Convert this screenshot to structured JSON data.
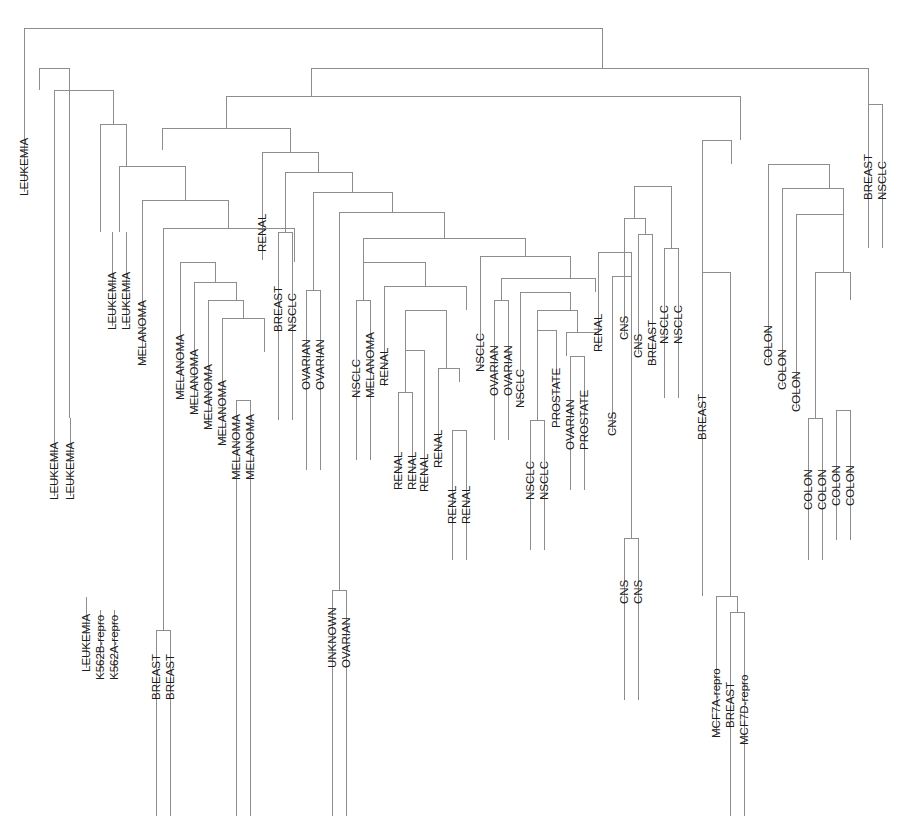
{
  "figure": {
    "title": "",
    "type": "dendrogram",
    "orientation": "top-down",
    "leaf_count": 64,
    "line_color": "#8d8d8d",
    "label_color": "#1c1c1c",
    "background": "#ffffff"
  },
  "chart_data": {
    "type": "dendrogram",
    "title": "",
    "xlabel": "",
    "ylabel": "",
    "grid": false,
    "legend": "none",
    "orientation": "vertical-top-root",
    "leaf_labels": [
      "LEUKEMIA",
      "LEUKEMIA",
      "LEUKEMIA",
      "LEUKEMIA",
      "K562B-repro",
      "K562A-repro",
      "LEUKEMIA",
      "LEUKEMIA",
      "MELANOMA",
      "BREAST",
      "BREAST",
      "MELANOMA",
      "MELANOMA",
      "MELANOMA",
      "MELANOMA",
      "MELANOMA",
      "MELANOMA",
      "RENAL",
      "BREAST",
      "NSCLC",
      "OVARIAN",
      "OVARIAN",
      "UNKNOWN",
      "OVARIAN",
      "NSCLC",
      "MELANOMA",
      "RENAL",
      "RENAL",
      "RENAL",
      "RENAL",
      "RENAL",
      "RENAL",
      "RENAL",
      "NSCLC",
      "OVARIAN",
      "OVARIAN",
      "NSCLC",
      "NSCLC",
      "NSCLC",
      "PROSTATE",
      "OVARIAN",
      "PROSTATE",
      "RENAL",
      "CNS",
      "CNS",
      "CNS",
      "CNS",
      "CNS",
      "BREAST",
      "NSCLC",
      "NSCLC",
      "BREAST",
      "MCF7A-repro",
      "BREAST",
      "MCF7D-repro",
      "COLON",
      "COLON",
      "COLON",
      "COLON",
      "COLON",
      "COLON",
      "COLON",
      "BREAST",
      "NSCLC"
    ],
    "leaf_x": [
      24,
      54,
      84,
      100,
      114,
      128,
      148,
      162,
      178,
      164,
      178,
      196,
      210,
      224,
      238,
      248,
      262,
      260,
      274,
      288,
      303,
      317,
      332,
      346,
      358,
      372,
      386,
      399,
      412,
      426,
      450,
      463,
      477,
      487,
      500,
      513,
      527,
      540,
      553,
      566,
      579,
      592,
      607,
      623,
      637,
      651,
      629,
      643,
      657,
      671,
      685,
      703,
      717,
      731,
      745,
      779,
      793,
      807,
      818,
      829,
      842,
      855,
      869,
      883
    ],
    "merge_heights_note": "Heights read from pixel y positions of horizontal join bars; smaller y = larger distance."
  },
  "labels": {
    "leukemia": "LEUKEMIA",
    "k562b": "K562B-repro",
    "k562a": "K562A-repro",
    "melanoma": "MELANOMA",
    "breast": "BREAST",
    "nsclc": "NSCLC",
    "renal": "RENAL",
    "ovarian": "OVARIAN",
    "unknown": "UNKNOWN",
    "prostate": "PROSTATE",
    "cns": "CNS",
    "colon": "COLON",
    "mcf7a": "MCF7A-repro",
    "mcf7d": "MCF7D-repro"
  },
  "leaves": [
    {
      "label": "LEUKEMIA",
      "x": 24,
      "y": 52,
      "label_y": 196
    },
    {
      "label": "LEUKEMIA",
      "x": 54,
      "y": 418,
      "label_y": 500
    },
    {
      "label": "LEUKEMIA",
      "x": 70,
      "y": 418,
      "label_y": 500
    },
    {
      "label": "LEUKEMIA",
      "x": 86,
      "y": 597,
      "label_y": 672
    },
    {
      "label": "K562B-repro",
      "x": 100,
      "y": 610,
      "label_y": 680
    },
    {
      "label": "K562A-repro",
      "x": 114,
      "y": 610,
      "label_y": 680
    },
    {
      "label": "LEUKEMIA",
      "x": 112,
      "y": 232,
      "label_y": 330
    },
    {
      "label": "LEUKEMIA",
      "x": 126,
      "y": 232,
      "label_y": 330
    },
    {
      "label": "MELANOMA",
      "x": 142,
      "y": 270,
      "label_y": 366
    },
    {
      "label": "BREAST",
      "x": 156,
      "y": 630,
      "label_y": 700
    },
    {
      "label": "BREAST",
      "x": 170,
      "y": 630,
      "label_y": 700
    },
    {
      "label": "MELANOMA",
      "x": 180,
      "y": 305,
      "label_y": 400
    },
    {
      "label": "MELANOMA",
      "x": 194,
      "y": 320,
      "label_y": 415
    },
    {
      "label": "MELANOMA",
      "x": 208,
      "y": 336,
      "label_y": 430
    },
    {
      "label": "MELANOMA",
      "x": 222,
      "y": 348,
      "label_y": 446
    },
    {
      "label": "MELANOMA",
      "x": 236,
      "y": 400,
      "label_y": 480
    },
    {
      "label": "MELANOMA",
      "x": 250,
      "y": 400,
      "label_y": 480
    },
    {
      "label": "RENAL",
      "x": 262,
      "y": 152,
      "label_y": 252
    },
    {
      "label": "BREAST",
      "x": 278,
      "y": 232,
      "label_y": 332
    },
    {
      "label": "NSCLC",
      "x": 292,
      "y": 232,
      "label_y": 332
    },
    {
      "label": "OVARIAN",
      "x": 306,
      "y": 290,
      "label_y": 390
    },
    {
      "label": "OVARIAN",
      "x": 320,
      "y": 290,
      "label_y": 390
    },
    {
      "label": "UNKNOWN",
      "x": 332,
      "y": 590,
      "label_y": 668
    },
    {
      "label": "OVARIAN",
      "x": 346,
      "y": 590,
      "label_y": 668
    },
    {
      "label": "NSCLC",
      "x": 356,
      "y": 300,
      "label_y": 398
    },
    {
      "label": "MELANOMA",
      "x": 370,
      "y": 300,
      "label_y": 398
    },
    {
      "label": "RENAL",
      "x": 384,
      "y": 286,
      "label_y": 386
    },
    {
      "label": "RENAL",
      "x": 398,
      "y": 392,
      "label_y": 490
    },
    {
      "label": "RENAL",
      "x": 412,
      "y": 392,
      "label_y": 490
    },
    {
      "label": "RENAL",
      "x": 424,
      "y": 398,
      "label_y": 492
    },
    {
      "label": "RENAL",
      "x": 438,
      "y": 368,
      "label_y": 468
    },
    {
      "label": "RENAL",
      "x": 452,
      "y": 430,
      "label_y": 524
    },
    {
      "label": "RENAL",
      "x": 466,
      "y": 430,
      "label_y": 524
    },
    {
      "label": "NSCLC",
      "x": 480,
      "y": 272,
      "label_y": 372
    },
    {
      "label": "OVARIAN",
      "x": 494,
      "y": 300,
      "label_y": 396
    },
    {
      "label": "OVARIAN",
      "x": 508,
      "y": 300,
      "label_y": 396
    },
    {
      "label": "NSCLC",
      "x": 520,
      "y": 312,
      "label_y": 408
    },
    {
      "label": "NSCLC",
      "x": 530,
      "y": 420,
      "label_y": 500
    },
    {
      "label": "NSCLC",
      "x": 544,
      "y": 420,
      "label_y": 500
    },
    {
      "label": "PROSTATE",
      "x": 556,
      "y": 332,
      "label_y": 428
    },
    {
      "label": "OVARIAN",
      "x": 570,
      "y": 356,
      "label_y": 450
    },
    {
      "label": "PROSTATE",
      "x": 584,
      "y": 356,
      "label_y": 450
    },
    {
      "label": "RENAL",
      "x": 598,
      "y": 252,
      "label_y": 352
    },
    {
      "label": "CNS",
      "x": 612,
      "y": 362,
      "label_y": 436
    },
    {
      "label": "CNS",
      "x": 624,
      "y": 538,
      "label_y": 604
    },
    {
      "label": "CNS",
      "x": 638,
      "y": 538,
      "label_y": 604
    },
    {
      "label": "CNS",
      "x": 624,
      "y": 250,
      "label_y": 340
    },
    {
      "label": "CNS",
      "x": 638,
      "y": 268,
      "label_y": 358
    },
    {
      "label": "BREAST",
      "x": 652,
      "y": 268,
      "label_y": 366
    },
    {
      "label": "NSCLC",
      "x": 664,
      "y": 248,
      "label_y": 344
    },
    {
      "label": "NSCLC",
      "x": 678,
      "y": 248,
      "label_y": 344
    },
    {
      "label": "BREAST",
      "x": 702,
      "y": 272,
      "label_y": 440
    },
    {
      "label": "MCF7A-repro",
      "x": 716,
      "y": 630,
      "label_y": 738
    },
    {
      "label": "BREAST",
      "x": 730,
      "y": 630,
      "label_y": 728
    },
    {
      "label": "MCF7D-repro",
      "x": 744,
      "y": 645,
      "label_y": 745
    },
    {
      "label": "COLON",
      "x": 768,
      "y": 268,
      "label_y": 366
    },
    {
      "label": "COLON",
      "x": 782,
      "y": 292,
      "label_y": 390
    },
    {
      "label": "COLON",
      "x": 796,
      "y": 316,
      "label_y": 412
    },
    {
      "label": "COLON",
      "x": 808,
      "y": 418,
      "label_y": 510
    },
    {
      "label": "COLON",
      "x": 822,
      "y": 418,
      "label_y": 510
    },
    {
      "label": "COLON",
      "x": 836,
      "y": 410,
      "label_y": 506
    },
    {
      "label": "COLON",
      "x": 850,
      "y": 410,
      "label_y": 506
    },
    {
      "label": "BREAST",
      "x": 868,
      "y": 104,
      "label_y": 200
    },
    {
      "label": "NSCLC",
      "x": 882,
      "y": 104,
      "label_y": 200
    }
  ],
  "links": [
    {
      "x1": 24,
      "x2": 602,
      "y": 28,
      "p1y": 52,
      "p2y": 68,
      "name": "root"
    },
    {
      "x1": 39,
      "x2": 69,
      "y": 68,
      "p1y": 90,
      "p2y": 418,
      "name": "leuk-node-a"
    },
    {
      "x1": 54,
      "x2": 113,
      "y": 90,
      "p1y": 418,
      "p2y": 124,
      "name": "leuk-node-b"
    },
    {
      "x1": 100,
      "x2": 126,
      "y": 124,
      "p1y": 232,
      "p2y": 166,
      "name": "leuk-node-c"
    },
    {
      "x1": 119,
      "x2": 185,
      "y": 166,
      "p1y": 232,
      "p2y": 200,
      "name": "mel-clade-root"
    },
    {
      "x1": 142,
      "x2": 228,
      "y": 200,
      "p1y": 270,
      "p2y": 228,
      "name": "mel-node-a"
    },
    {
      "x1": 163,
      "x2": 294,
      "y": 228,
      "p1y": 630,
      "p2y": 262,
      "name": "mel-node-b"
    },
    {
      "x1": 156,
      "x2": 170,
      "y": 630,
      "p1y": 816,
      "p2y": 816,
      "name": "breast-pair-low"
    },
    {
      "x1": 180,
      "x2": 215,
      "y": 262,
      "p1y": 305,
      "p2y": 282,
      "name": "mel-node-c"
    },
    {
      "x1": 194,
      "x2": 236,
      "y": 282,
      "p1y": 320,
      "p2y": 300,
      "name": "mel-node-d"
    },
    {
      "x1": 208,
      "x2": 243,
      "y": 300,
      "p1y": 336,
      "p2y": 318,
      "name": "mel-node-e"
    },
    {
      "x1": 222,
      "x2": 264,
      "y": 318,
      "p1y": 348,
      "p2y": 352,
      "name": "mel-node-f"
    },
    {
      "x1": 236,
      "x2": 250,
      "y": 400,
      "p1y": 816,
      "p2y": 816,
      "name": "mel-pair-low"
    },
    {
      "x1": 311,
      "x2": 868,
      "y": 68,
      "p1y": 96,
      "p2y": 104,
      "name": "right-root"
    },
    {
      "x1": 868,
      "x2": 882,
      "y": 104,
      "p1y": 248,
      "p2y": 248,
      "name": "breast-nsclc-pair"
    },
    {
      "x1": 226,
      "x2": 740,
      "y": 96,
      "p1y": 128,
      "p2y": 140,
      "name": "mid-root"
    },
    {
      "x1": 162,
      "x2": 290,
      "y": 128,
      "p1y": 150,
      "p2y": 152,
      "name": "mid-left"
    },
    {
      "x1": 262,
      "x2": 318,
      "y": 152,
      "p1y": 260,
      "p2y": 172,
      "name": "renal-top"
    },
    {
      "x1": 278,
      "x2": 292,
      "y": 232,
      "p1y": 420,
      "p2y": 420,
      "name": "breast-nsclc-232"
    },
    {
      "x1": 285,
      "x2": 352,
      "y": 172,
      "p1y": 232,
      "p2y": 192,
      "name": "mid-left-b"
    },
    {
      "x1": 313,
      "x2": 392,
      "y": 192,
      "p1y": 290,
      "p2y": 212,
      "name": "mid-left-c"
    },
    {
      "x1": 306,
      "x2": 320,
      "y": 290,
      "p1y": 470,
      "p2y": 470,
      "name": "ovarian-pair"
    },
    {
      "x1": 332,
      "x2": 346,
      "y": 590,
      "p1y": 816,
      "p2y": 816,
      "name": "unknown-ovarian"
    },
    {
      "x1": 339,
      "x2": 444,
      "y": 212,
      "p1y": 590,
      "p2y": 238,
      "name": "mid-left-d"
    },
    {
      "x1": 363,
      "x2": 525,
      "y": 238,
      "p1y": 262,
      "p2y": 256,
      "name": "mid-left-e"
    },
    {
      "x1": 356,
      "x2": 370,
      "y": 300,
      "p1y": 460,
      "p2y": 460,
      "name": "nsclc-melanoma"
    },
    {
      "x1": 363,
      "x2": 425,
      "y": 262,
      "p1y": 300,
      "p2y": 286,
      "name": "renal-grp-a"
    },
    {
      "x1": 384,
      "x2": 466,
      "y": 286,
      "p1y": 386,
      "p2y": 310,
      "name": "renal-grp-b"
    },
    {
      "x1": 405,
      "x2": 446,
      "y": 310,
      "p1y": 350,
      "p2y": 368,
      "name": "renal-grp-c"
    },
    {
      "x1": 398,
      "x2": 412,
      "y": 392,
      "p1y": 480,
      "p2y": 480,
      "name": "renal-pair-1"
    },
    {
      "x1": 405,
      "x2": 424,
      "y": 350,
      "p1y": 392,
      "p2y": 398,
      "name": "renal-node-1"
    },
    {
      "x1": 438,
      "x2": 459,
      "y": 368,
      "p1y": 430,
      "p2y": 382,
      "name": "renal-node-2"
    },
    {
      "x1": 452,
      "x2": 466,
      "y": 430,
      "p1y": 560,
      "p2y": 560,
      "name": "renal-pair-2"
    },
    {
      "x1": 480,
      "x2": 570,
      "y": 256,
      "p1y": 272,
      "p2y": 278,
      "name": "nsclc-ov-root"
    },
    {
      "x1": 501,
      "x2": 595,
      "y": 278,
      "p1y": 300,
      "p2y": 292,
      "name": "nsclc-ov-a"
    },
    {
      "x1": 494,
      "x2": 508,
      "y": 300,
      "p1y": 440,
      "p2y": 440,
      "name": "ovarian-pair-2"
    },
    {
      "x1": 520,
      "x2": 570,
      "y": 292,
      "p1y": 312,
      "p2y": 310,
      "name": "nsclc-ov-b"
    },
    {
      "x1": 537,
      "x2": 577,
      "y": 310,
      "p1y": 330,
      "p2y": 332,
      "name": "nsclc-prost-a"
    },
    {
      "x1": 530,
      "x2": 544,
      "y": 420,
      "p1y": 550,
      "p2y": 550,
      "name": "nsclc-pair"
    },
    {
      "x1": 537,
      "x2": 556,
      "y": 330,
      "p1y": 420,
      "p2y": 332,
      "name": "nsclc-prost-b"
    },
    {
      "x1": 570,
      "x2": 584,
      "y": 356,
      "p1y": 490,
      "p2y": 490,
      "name": "ovarian-prostate"
    },
    {
      "x1": 566,
      "x2": 598,
      "y": 332,
      "p1y": 356,
      "p2y": 340,
      "name": "prost-node"
    },
    {
      "x1": 598,
      "x2": 631,
      "y": 252,
      "p1y": 340,
      "p2y": 276,
      "name": "renal-cns-node"
    },
    {
      "x1": 612,
      "x2": 631,
      "y": 276,
      "p1y": 362,
      "p2y": 538,
      "name": "cns-node-1"
    },
    {
      "x1": 624,
      "x2": 638,
      "y": 538,
      "p1y": 700,
      "p2y": 700,
      "name": "cns-pair-low"
    },
    {
      "x1": 624,
      "x2": 645,
      "y": 218,
      "p1y": 250,
      "p2y": 234,
      "name": "cns-breast-a"
    },
    {
      "x1": 638,
      "x2": 652,
      "y": 234,
      "p1y": 268,
      "p2y": 268,
      "name": "cns-breast-b"
    },
    {
      "x1": 664,
      "x2": 678,
      "y": 248,
      "p1y": 398,
      "p2y": 398,
      "name": "nsclc-pair-right"
    },
    {
      "x1": 634,
      "x2": 671,
      "y": 186,
      "p1y": 218,
      "p2y": 248,
      "name": "cns-nsclc-node"
    },
    {
      "x1": 702,
      "x2": 731,
      "y": 140,
      "p1y": 272,
      "p2y": 164,
      "name": "breast-colon-root"
    },
    {
      "x1": 702,
      "x2": 730,
      "y": 272,
      "p1y": 596,
      "p2y": 596,
      "name": "breast-mcf-node"
    },
    {
      "x1": 716,
      "x2": 737,
      "y": 596,
      "p1y": 630,
      "p2y": 612,
      "name": "mcf7a-node"
    },
    {
      "x1": 730,
      "x2": 744,
      "y": 612,
      "p1y": 816,
      "p2y": 816,
      "name": "mcf7-pair"
    },
    {
      "x1": 768,
      "x2": 829,
      "y": 164,
      "p1y": 268,
      "p2y": 188,
      "name": "colon-root"
    },
    {
      "x1": 782,
      "x2": 843,
      "y": 188,
      "p1y": 292,
      "p2y": 214,
      "name": "colon-a"
    },
    {
      "x1": 796,
      "x2": 843,
      "y": 214,
      "p1y": 316,
      "p2y": 272,
      "name": "colon-b"
    },
    {
      "x1": 815,
      "x2": 850,
      "y": 272,
      "p1y": 418,
      "p2y": 300,
      "name": "colon-c"
    },
    {
      "x1": 808,
      "x2": 822,
      "y": 418,
      "p1y": 560,
      "p2y": 560,
      "name": "colon-pair-1"
    },
    {
      "x1": 836,
      "x2": 850,
      "y": 410,
      "p1y": 540,
      "p2y": 540,
      "name": "colon-pair-2"
    }
  ]
}
